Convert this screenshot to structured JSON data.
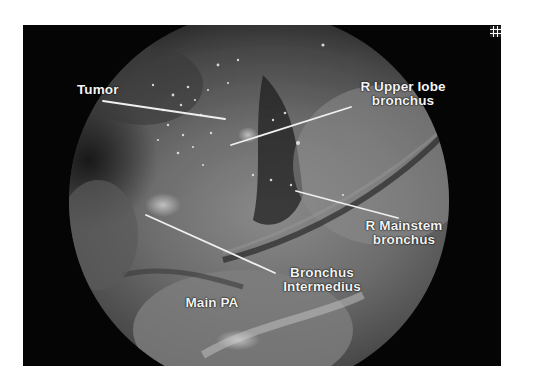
{
  "figure": {
    "type": "annotated endoscopic (thoracoscopic) surgical photograph",
    "colors": {
      "background": "#ffffff",
      "frame": "#050505",
      "label_text": "#f4f4f4",
      "leader_line": "#f0f0f0"
    },
    "labels": {
      "tumor": "Tumor",
      "r_upper_lobe_line1": "R Upper lobe",
      "r_upper_lobe_line2": "bronchus",
      "r_mainstem_line1": "R Mainstem",
      "r_mainstem_line2": "bronchus",
      "bronchus_intermedius_line1": "Bronchus",
      "bronchus_intermedius_line2": "Intermedius",
      "main_pa": "Main PA"
    },
    "corner_icon": "grid-icon"
  }
}
